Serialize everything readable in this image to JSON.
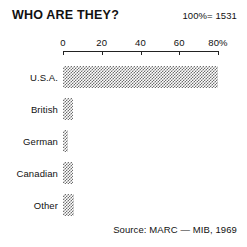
{
  "header": {
    "title": "WHO ARE THEY?",
    "total_note": "100%= 1531"
  },
  "footer": {
    "source": "Source: MARC — MIB, 1969"
  },
  "axis": {
    "tick_labels": [
      "0",
      "20",
      "40",
      "60",
      "80%"
    ],
    "tick_values": [
      0,
      20,
      40,
      60,
      80
    ]
  },
  "colors": {
    "bar_fill": "#6f6f6f",
    "axis": "#222222",
    "text": "#111111",
    "background": "#ffffff"
  },
  "chart_data": {
    "type": "bar",
    "orientation": "horizontal",
    "title": "WHO ARE THEY?",
    "subtitle": "100%= 1531",
    "xlabel": "",
    "ylabel": "",
    "xlim": [
      0,
      80
    ],
    "xticks": [
      0,
      20,
      40,
      60,
      80
    ],
    "xticklabels": [
      "0",
      "20",
      "40",
      "60",
      "80%"
    ],
    "grid": false,
    "legend": false,
    "units": "percent",
    "total": 1531,
    "source": "Source: MARC — MIB, 1969",
    "categories": [
      "U.S.A.",
      "British",
      "German",
      "Canadian",
      "Other"
    ],
    "values": [
      80,
      5,
      2.5,
      5,
      5.5
    ],
    "bars": [
      {
        "label": "U.S.A.",
        "value": 80
      },
      {
        "label": "British",
        "value": 5
      },
      {
        "label": "German",
        "value": 2.5
      },
      {
        "label": "Canadian",
        "value": 5
      },
      {
        "label": "Other",
        "value": 5.5
      }
    ]
  }
}
